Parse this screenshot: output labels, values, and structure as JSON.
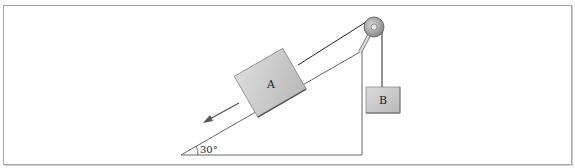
{
  "figure": {
    "block_a": {
      "label": "A"
    },
    "block_b": {
      "label": "B"
    },
    "angle": {
      "label": "30°",
      "degrees": 30
    },
    "motion_arrow": {
      "direction": "down-slope"
    },
    "colors": {
      "block_fill": "#c8c8c8",
      "block_edge": "#8a8a8a",
      "line": "#333333",
      "pulley": "#9a9a9a",
      "frame": "#a8a8a8"
    }
  }
}
